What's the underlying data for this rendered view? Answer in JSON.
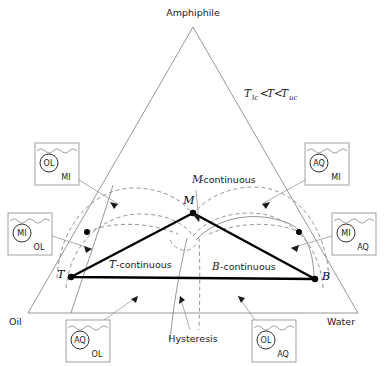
{
  "figure": {
    "type": "ternary-phase-diagram",
    "vertices": {
      "top": "Amphiphile",
      "bottom_left": "Oil",
      "bottom_right": "Water"
    },
    "condition_note": "T",
    "condition_full": "Tlc<T<Tuc",
    "condition_parts": {
      "t1": "T",
      "sub1": "lc",
      "op1": "<",
      "t2": "T",
      "op2": "<",
      "t3": "T",
      "sub2": "uc"
    },
    "inner_triangle_vertices": [
      {
        "id": "M",
        "label": "M",
        "x": 193,
        "y": 213
      },
      {
        "id": "T",
        "label": "T",
        "x": 71,
        "y": 277
      },
      {
        "id": "B",
        "label": "B",
        "x": 315,
        "y": 279
      }
    ],
    "region_labels": [
      {
        "name": "m-continuous",
        "text": "M-continuous",
        "italic_prefix": "M",
        "rest": "-continuous"
      },
      {
        "name": "t-continuous",
        "text": "T-continuous",
        "italic_prefix": "T",
        "rest": "-continuous"
      },
      {
        "name": "b-continuous",
        "text": "B-continuous",
        "italic_prefix": "B",
        "rest": "-continuous"
      }
    ],
    "hysteresis_label": "Hysteresis",
    "tie_dots": [
      {
        "name": "left-node-dot",
        "x": 87,
        "y": 232
      },
      {
        "name": "right-node-dot",
        "x": 299,
        "y": 232
      },
      {
        "name": "apex-node-dot",
        "x": 193,
        "y": 213
      }
    ],
    "beakers": [
      {
        "name": "beaker-ol-in-mi",
        "dispersed": "OL",
        "continuous": "MI",
        "x": 35,
        "y": 143,
        "w": 44,
        "h": 42
      },
      {
        "name": "beaker-aq-in-mi",
        "dispersed": "AQ",
        "continuous": "MI",
        "x": 305,
        "y": 143,
        "w": 44,
        "h": 42
      },
      {
        "name": "beaker-mi-in-ol",
        "dispersed": "MI",
        "continuous": "OL",
        "x": 8,
        "y": 213,
        "w": 44,
        "h": 42
      },
      {
        "name": "beaker-mi-in-aq",
        "dispersed": "MI",
        "continuous": "AQ",
        "x": 332,
        "y": 213,
        "w": 44,
        "h": 42
      },
      {
        "name": "beaker-aq-in-ol",
        "dispersed": "AQ",
        "continuous": "OL",
        "x": 66,
        "y": 320,
        "w": 44,
        "h": 42
      },
      {
        "name": "beaker-ol-in-aq",
        "dispersed": "OL",
        "continuous": "AQ",
        "x": 252,
        "y": 320,
        "w": 44,
        "h": 42
      }
    ],
    "colors": {
      "ink": "#1a1a1a",
      "grey_line": "#8a8a8a",
      "heavy_line": "#000000",
      "background": "#ffffff"
    }
  }
}
